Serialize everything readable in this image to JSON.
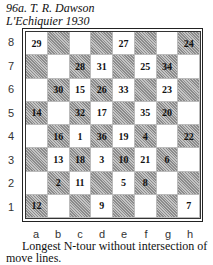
{
  "header": {
    "line1": "96a. T. R. Dawson",
    "line2": "L'Echiquier 1930"
  },
  "board": {
    "ranks": [
      "8",
      "7",
      "6",
      "5",
      "4",
      "3",
      "2",
      "1"
    ],
    "files": [
      "a",
      "b",
      "c",
      "d",
      "e",
      "f",
      "g",
      "h"
    ],
    "rows": [
      [
        "29",
        "",
        "",
        "",
        "27",
        "",
        "",
        "24"
      ],
      [
        "",
        "",
        "28",
        "31",
        "",
        "25",
        "34",
        ""
      ],
      [
        "",
        "30",
        "15",
        "26",
        "33",
        "",
        "23",
        ""
      ],
      [
        "14",
        "",
        "32",
        "17",
        "",
        "35",
        "20",
        ""
      ],
      [
        "",
        "16",
        "1",
        "36",
        "19",
        "4",
        "",
        "22"
      ],
      [
        "",
        "13",
        "18",
        "3",
        "10",
        "21",
        "6",
        ""
      ],
      [
        "",
        "2",
        "11",
        "",
        "5",
        "8",
        "",
        ""
      ],
      [
        "12",
        "",
        "",
        "9",
        "",
        "",
        "",
        "7"
      ]
    ]
  },
  "caption": "Longest N-tour without intersection of move lines."
}
